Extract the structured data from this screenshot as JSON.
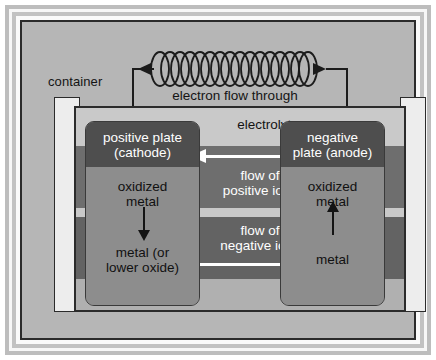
{
  "diagram": {
    "container_label": "container",
    "external_circuit": {
      "caption_line1": "electron flow through",
      "caption_line2": "external circuit",
      "coil_name": "resistor-coil",
      "arrow_left_name": "electron-flow-arrow-left",
      "arrow_right_name": "electron-flow-arrow-right"
    },
    "electrolyte": {
      "label": "electrolyte",
      "positive_flow_line1": "flow of",
      "positive_flow_line2": "positive ions",
      "negative_flow_line1": "flow of",
      "negative_flow_line2": "negative ions"
    },
    "left_plate": {
      "head_line1": "positive plate",
      "head_line2": "(cathode)",
      "reactant_line1": "oxidized",
      "reactant_line2": "metal",
      "product_line1": "metal (or",
      "product_line2": "lower oxide)",
      "arrow_direction": "down"
    },
    "right_plate": {
      "head_line1": "negative",
      "head_line2": "plate (anode)",
      "reactant_line1": "oxidized",
      "reactant_line2": "metal",
      "product_line1": "metal",
      "product_line2": "",
      "arrow_direction": "up"
    },
    "colors": {
      "canvas_gray": "#b6b6b6",
      "band_light": "#c9c9c9",
      "band_positive": "#6e6e6e",
      "band_negative": "#636363",
      "plate_head": "#4e4e4e",
      "plate_body": "#8d8d8d",
      "wall": "#ededed",
      "ink": "#1c1c1c",
      "arrow_white": "#ffffff"
    }
  }
}
